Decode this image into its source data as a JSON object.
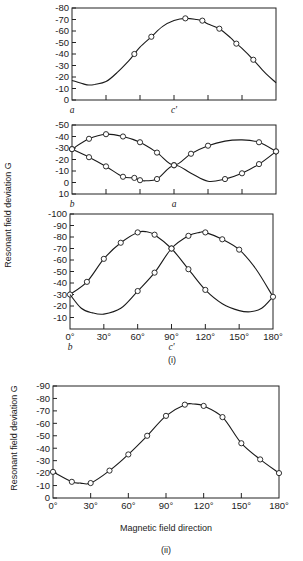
{
  "figure": {
    "ylabel_i": "Resonant field deviation G",
    "ylabel_ii": "Resonant field deviation G",
    "part_i_caption": "(i)",
    "part_ii_caption": "(ii)",
    "xlabel_ii": "Magnetic field direction"
  },
  "chart_data": [
    {
      "type": "line",
      "panel": "i-top",
      "title": "",
      "xlabel": "",
      "ylabel": "Resonant field deviation G",
      "x_range": [
        0,
        180
      ],
      "ylim": [
        0,
        80
      ],
      "yticks": [
        "0",
        "-10",
        "-20",
        "-30",
        "-40",
        "-50",
        "-60",
        "-70",
        "-80"
      ],
      "ytick_values": [
        0,
        10,
        20,
        30,
        40,
        50,
        60,
        70,
        80
      ],
      "x_axis_letters": [
        {
          "x": 0,
          "label": "a"
        },
        {
          "x": 90,
          "label": "c'"
        }
      ],
      "xtick_positions": [
        30,
        60,
        90,
        120,
        150
      ],
      "series": [
        {
          "name": "line 1",
          "x": [
            55,
            70,
            100,
            115,
            130,
            145,
            160
          ],
          "values": [
            40,
            55,
            71,
            69,
            62,
            49,
            35
          ],
          "curve_x": [
            0,
            10,
            15,
            20,
            30,
            40,
            50,
            55,
            60,
            70,
            80,
            90,
            100,
            110,
            115,
            120,
            130,
            140,
            145,
            150,
            160,
            170,
            180
          ],
          "curve_y": [
            17,
            14,
            13,
            13.5,
            16,
            24,
            34,
            40,
            46,
            55,
            64,
            69,
            71,
            70,
            69,
            66,
            62,
            54,
            49,
            45,
            35,
            24,
            15
          ]
        }
      ],
      "grid": false,
      "legend": "none"
    },
    {
      "type": "line",
      "panel": "i-middle",
      "title": "",
      "xlabel": "",
      "ylabel": "Resonant field deviation G",
      "x_range": [
        0,
        180
      ],
      "ylim": [
        -10,
        50
      ],
      "yticks": [
        "10",
        "0",
        "-10",
        "-20",
        "-30",
        "-40",
        "-50"
      ],
      "ytick_values": [
        -10,
        0,
        10,
        20,
        30,
        40,
        50
      ],
      "x_axis_letters": [
        {
          "x": 0,
          "label": "b"
        },
        {
          "x": 90,
          "label": "a"
        }
      ],
      "xtick_positions": [
        30,
        60,
        90,
        120,
        150
      ],
      "series": [
        {
          "name": "line 1",
          "x": [
            0,
            15,
            30,
            45,
            60,
            75,
            90,
            105,
            120,
            165,
            180
          ],
          "values": [
            29,
            38,
            42,
            40,
            35,
            26,
            15,
            25,
            32,
            35,
            27
          ],
          "curve_x": [
            0,
            15,
            30,
            45,
            60,
            75,
            90,
            105,
            120,
            135,
            150,
            165,
            180
          ],
          "curve_y": [
            29,
            38,
            42,
            40,
            35,
            26,
            15,
            25,
            32,
            36,
            37,
            35,
            27
          ]
        },
        {
          "name": "line 2",
          "x": [
            0,
            15,
            30,
            45,
            55,
            60,
            75,
            90,
            135,
            150,
            165,
            180
          ],
          "values": [
            29,
            22,
            14,
            5,
            4,
            2,
            3,
            15,
            3,
            8,
            16,
            27
          ],
          "curve_x": [
            0,
            15,
            30,
            45,
            55,
            60,
            65,
            75,
            90,
            105,
            120,
            135,
            150,
            165,
            180
          ],
          "curve_y": [
            29,
            22,
            14,
            5,
            4,
            2,
            1.5,
            3,
            15,
            8,
            1,
            3,
            8,
            16,
            27
          ]
        }
      ],
      "grid": false,
      "legend": "none"
    },
    {
      "type": "line",
      "panel": "i-bottom",
      "title": "",
      "xlabel": "",
      "ylabel": "Resonant field deviation G",
      "x_range": [
        0,
        180
      ],
      "ylim": [
        0,
        100
      ],
      "yticks": [
        "-10",
        "-20",
        "-30",
        "-40",
        "-50",
        "-60",
        "-70",
        "-80",
        "-90",
        "-100"
      ],
      "ytick_values": [
        10,
        20,
        30,
        40,
        50,
        60,
        70,
        80,
        90,
        100
      ],
      "xtick_labels": [
        "0°",
        "30°",
        "60°",
        "90°",
        "120°",
        "150°",
        "180°"
      ],
      "xtick_positions": [
        0,
        30,
        60,
        90,
        120,
        150,
        180
      ],
      "x_axis_letters": [
        {
          "x": 0,
          "label": "b"
        },
        {
          "x": 90,
          "label": "c'"
        }
      ],
      "series": [
        {
          "name": "line 1",
          "x": [
            0,
            15,
            30,
            45,
            60,
            75,
            90,
            105,
            120
          ],
          "values": [
            30,
            41,
            61,
            75,
            84,
            82,
            70,
            52,
            34
          ],
          "curve_x": [
            0,
            15,
            30,
            45,
            60,
            68,
            75,
            90,
            105,
            120,
            135,
            150,
            160,
            170,
            180
          ],
          "curve_y": [
            30,
            41,
            61,
            75,
            84,
            84.5,
            82,
            70,
            52,
            34,
            22,
            16,
            15,
            18,
            28
          ]
        },
        {
          "name": "line 2",
          "x": [
            60,
            75,
            90,
            105,
            120,
            135,
            150,
            180
          ],
          "values": [
            33,
            49,
            70,
            81,
            84,
            78,
            69,
            28
          ],
          "curve_x": [
            0,
            10,
            20,
            30,
            45,
            60,
            75,
            90,
            105,
            115,
            120,
            135,
            150,
            165,
            180
          ],
          "curve_y": [
            30,
            18,
            14,
            13,
            18,
            33,
            49,
            70,
            81,
            84,
            84,
            78,
            69,
            52,
            28
          ]
        }
      ],
      "grid": false,
      "legend": "none"
    },
    {
      "type": "line",
      "panel": "ii",
      "title": "",
      "xlabel": "Magnetic field direction",
      "ylabel": "Resonant field deviation G",
      "x_range": [
        0,
        180
      ],
      "ylim": [
        0,
        90
      ],
      "yticks": [
        "0",
        "-10",
        "-20",
        "-30",
        "-40",
        "-50",
        "-60",
        "-70",
        "-80",
        "-90"
      ],
      "ytick_values": [
        0,
        10,
        20,
        30,
        40,
        50,
        60,
        70,
        80,
        90
      ],
      "xtick_labels": [
        "0°",
        "30°",
        "60°",
        "90°",
        "120°",
        "150°",
        "180°"
      ],
      "xtick_positions": [
        0,
        30,
        60,
        90,
        120,
        150,
        180
      ],
      "series": [
        {
          "name": "line 1",
          "x": [
            0,
            15,
            30,
            45,
            60,
            75,
            90,
            105,
            120,
            135,
            150,
            165,
            180
          ],
          "values": [
            21,
            13,
            12,
            22,
            35,
            50,
            66,
            75,
            74,
            65,
            44,
            31,
            20
          ],
          "curve_x": [
            0,
            15,
            22,
            30,
            45,
            60,
            75,
            90,
            105,
            112,
            120,
            135,
            150,
            165,
            180
          ],
          "curve_y": [
            21,
            13,
            12,
            12,
            22,
            35,
            50,
            66,
            75,
            75.5,
            74,
            65,
            44,
            31,
            20
          ]
        }
      ],
      "grid": false,
      "legend": "none"
    }
  ]
}
